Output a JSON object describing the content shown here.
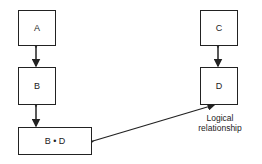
{
  "diagram": {
    "boxes": {
      "a": "A",
      "b": "B",
      "bd": "B • D",
      "c": "C",
      "d": "D"
    },
    "annotation": {
      "line1": "Logical",
      "line2": "relationship"
    },
    "colors": {
      "stroke": "#222222",
      "background": "#ffffff"
    }
  }
}
